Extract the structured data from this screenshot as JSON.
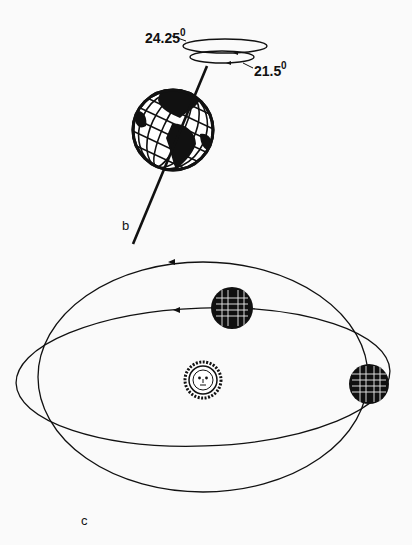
{
  "figure": {
    "panel_b": {
      "label": "b",
      "angle_outer": "24.25",
      "angle_inner": "21.5",
      "degree_symbol": "0"
    },
    "panel_c": {
      "label": "c"
    }
  },
  "colors": {
    "ink": "#111111",
    "background": "#fafafa"
  }
}
